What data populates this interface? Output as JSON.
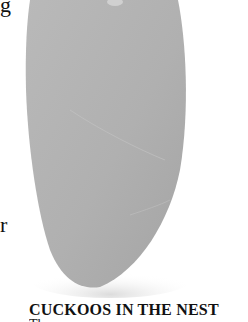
{
  "page": {
    "margin_letters": [
      "g",
      "r"
    ],
    "photo": {
      "subject": "egg",
      "description": "Elongated gray egg photographed against a white background",
      "egg_color": "#b2b2b2",
      "shadow_color": "#e6e6e6"
    },
    "section_heading": "CUCKOOS IN THE NEST",
    "body_text_cut": "The..."
  }
}
